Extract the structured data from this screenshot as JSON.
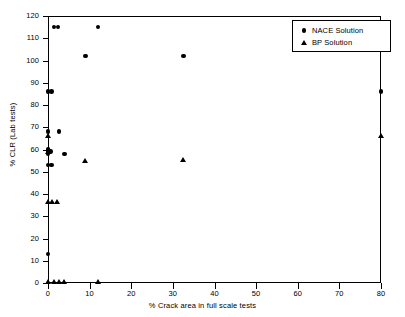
{
  "chart_data": {
    "type": "scatter",
    "title": "",
    "xlabel": "% Crack area in full scale tests",
    "ylabel": "% CLR (Lab tests)",
    "xlim": [
      0,
      80
    ],
    "ylim": [
      0,
      120
    ],
    "xticks": [
      0,
      10,
      20,
      30,
      40,
      50,
      60,
      70,
      80
    ],
    "yticks": [
      0,
      10,
      20,
      30,
      40,
      50,
      60,
      70,
      80,
      90,
      100,
      110,
      120
    ],
    "grid": false,
    "legend_position": "top-right",
    "marker_color": "#000000",
    "series": [
      {
        "name": "NACE Solution",
        "marker": "circle",
        "points": [
          [
            1.4,
            115
          ],
          [
            2.4,
            115
          ],
          [
            12.0,
            115
          ],
          [
            9.0,
            102
          ],
          [
            32.5,
            102
          ],
          [
            0.0,
            86
          ],
          [
            0.9,
            86
          ],
          [
            80.0,
            86
          ],
          [
            0.0,
            68
          ],
          [
            2.6,
            68
          ],
          [
            0.0,
            60
          ],
          [
            0.0,
            59
          ],
          [
            0.6,
            59
          ],
          [
            0.0,
            58
          ],
          [
            4.0,
            58
          ],
          [
            0.0,
            53
          ],
          [
            0.8,
            53
          ],
          [
            0.0,
            13
          ]
        ]
      },
      {
        "name": "BP Solution",
        "marker": "triangle",
        "points": [
          [
            0.0,
            66
          ],
          [
            80.0,
            66
          ],
          [
            0.4,
            60
          ],
          [
            0.0,
            59
          ],
          [
            9.0,
            55
          ],
          [
            32.5,
            55.5
          ],
          [
            0.0,
            36.5
          ],
          [
            1.0,
            36.5
          ],
          [
            2.1,
            36.5
          ],
          [
            0.0,
            0.5
          ],
          [
            1.5,
            0.5
          ],
          [
            2.6,
            0.5
          ],
          [
            4.0,
            0.5
          ],
          [
            12.0,
            0.5
          ]
        ]
      }
    ]
  },
  "legend": {
    "items": [
      {
        "label": "NACE Solution",
        "marker": "circle"
      },
      {
        "label": "BP Solution",
        "marker": "triangle"
      }
    ]
  }
}
